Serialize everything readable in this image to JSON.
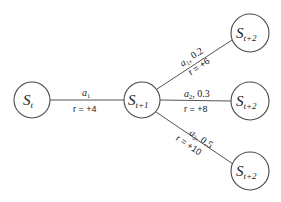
{
  "diagram": {
    "type": "state-transition-tree",
    "nodes": [
      {
        "id": "s_t",
        "base": "S",
        "subscript": "t",
        "cx": 32,
        "cy": 100,
        "r": 18
      },
      {
        "id": "s_t1",
        "base": "S",
        "subscript": "t+1",
        "cx": 142,
        "cy": 100,
        "r": 18
      },
      {
        "id": "s_t2_top",
        "base": "S",
        "subscript": "t+2",
        "cx": 250,
        "cy": 33,
        "r": 19
      },
      {
        "id": "s_t2_mid",
        "base": "S",
        "subscript": "t+2",
        "cx": 250,
        "cy": 101,
        "r": 19
      },
      {
        "id": "s_t2_bot",
        "base": "S",
        "subscript": "t+2",
        "cx": 250,
        "cy": 171,
        "r": 19
      }
    ],
    "edges": [
      {
        "from": "s_t",
        "to": "s_t1",
        "action": "a",
        "action_sub": "1",
        "prob": "",
        "reward": "r = +4"
      },
      {
        "from": "s_t1",
        "to": "s_t2_top",
        "action": "a",
        "action_sub": "1",
        "prob": ", 0.2",
        "reward": "r = +6"
      },
      {
        "from": "s_t1",
        "to": "s_t2_mid",
        "action": "a",
        "action_sub": "2",
        "prob": ", 0.3",
        "reward": "r = +8"
      },
      {
        "from": "s_t1",
        "to": "s_t2_bot",
        "action": "a",
        "action_sub": "3",
        "prob": ", 0.5",
        "reward": "r = +10"
      }
    ]
  }
}
